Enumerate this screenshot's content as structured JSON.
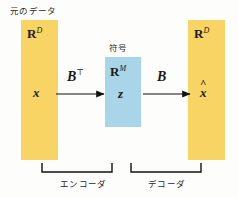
{
  "diagram": {
    "title_label": "元のデータ",
    "code_label": "符号",
    "input_space": "R",
    "input_space_dim": "D",
    "output_space": "R",
    "output_space_dim": "D",
    "code_space": "R",
    "code_space_dim": "M",
    "input_vector": "x",
    "code_vector": "z",
    "output_vector": "x",
    "output_vector_hat": "^",
    "encoder_matrix": "B",
    "encoder_matrix_sup": "⊤",
    "decoder_matrix": "B",
    "encoder_bracket_label": "エンコーダ",
    "decoder_bracket_label": "デコーダ",
    "colors": {
      "data_box": "#f7d463",
      "code_box": "#a8d5e8",
      "background": "#fdfdfb",
      "ink": "#1a1a1a"
    }
  }
}
